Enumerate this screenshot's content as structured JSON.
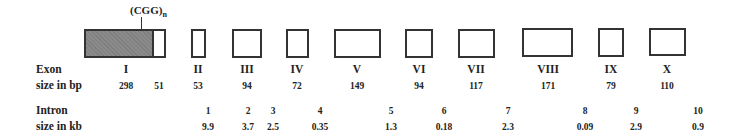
{
  "figure": {
    "repeat_label": "(CGG)",
    "repeat_subscript": "n",
    "row_labels": {
      "exon": "Exon",
      "exon_size": "size in bp",
      "intron": "Intron",
      "intron_size": "size in kb"
    },
    "exons": [
      {
        "name": "I",
        "sizes": [
          "298",
          "51"
        ]
      },
      {
        "name": "II",
        "size": "53"
      },
      {
        "name": "III",
        "size": "94"
      },
      {
        "name": "IV",
        "size": "72"
      },
      {
        "name": "V",
        "size": "149"
      },
      {
        "name": "VI",
        "size": "94"
      },
      {
        "name": "VII",
        "size": "117"
      },
      {
        "name": "VIII",
        "size": "171"
      },
      {
        "name": "IX",
        "size": "79"
      },
      {
        "name": "X",
        "size": "110"
      }
    ],
    "introns": [
      {
        "number": "1",
        "size": "9.9"
      },
      {
        "number": "2",
        "size": "3.7"
      },
      {
        "number": "3",
        "size": "2.5"
      },
      {
        "number": "4",
        "size": "0.35"
      },
      {
        "number": "5",
        "size": "1.3"
      },
      {
        "number": "6",
        "size": "0.18"
      },
      {
        "number": "7",
        "size": "2.3"
      },
      {
        "number": "8",
        "size": "0.09"
      },
      {
        "number": "9",
        "size": "2.9"
      },
      {
        "number": "10",
        "size": "0.9"
      }
    ],
    "colors": {
      "outline": "#333333",
      "shaded_exon": "#8a8a8a",
      "background": "#ffffff"
    }
  }
}
